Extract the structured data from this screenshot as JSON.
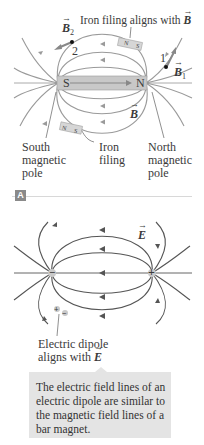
{
  "panel_a": {
    "badge": "A",
    "magnet": {
      "south_label": "S",
      "north_label": "N"
    },
    "iron_filing_top": {
      "n": "N",
      "s": "S"
    },
    "iron_filing_bottom": {
      "n": "N",
      "s": "S"
    },
    "labels": {
      "iron_filing_aligns": "Iron filing aligns with",
      "iron_filing_aligns_vec": "B",
      "b2": "B",
      "b2_sub": "2",
      "point2": "2",
      "point1": "1",
      "b1": "B",
      "b1_sub": "1",
      "b_field": "B",
      "south_pole_l1": "South",
      "south_pole_l2": "magnetic",
      "south_pole_l3": "pole",
      "iron_filing_l1": "Iron",
      "iron_filing_l2": "filing",
      "north_pole_l1": "North",
      "north_pole_l2": "magnetic",
      "north_pole_l3": "pole"
    }
  },
  "panel_b": {
    "labels": {
      "e_field": "E",
      "negative_charge": "−",
      "positive_charge": "+",
      "dipole_plus": "+",
      "dipole_minus": "−",
      "dipole_l1": "Electric dipole",
      "dipole_l2": "aligns with",
      "dipole_vec": "E"
    },
    "caption": "The electric field lines of an electric dipole are similar to the magnetic field lines of a bar magnet."
  },
  "colors": {
    "field_line_magnetic": "#9a9a9a",
    "field_line_electric": "#555555",
    "magnet_fill": "#c8c8c8",
    "caption_bg": "#e4e4e4",
    "badge_bg": "#8a8a8a"
  }
}
